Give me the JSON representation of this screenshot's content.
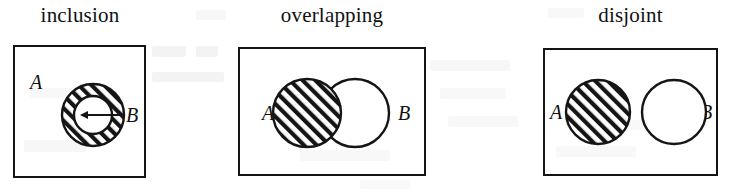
{
  "figure": {
    "caption_type": "venn-diagram-set-relations",
    "stroke_color": "#151515",
    "background_color": "#ffffff",
    "hatch_color": "#151515",
    "panels": [
      {
        "id": "inclusion",
        "title": "inclusion",
        "label_a": "A",
        "label_b": "B",
        "relation": "B is a subset of A",
        "box": {
          "x": 13,
          "y": 45,
          "w": 133,
          "h": 133
        },
        "shapes": {
          "outer_circle": {
            "cx": 93,
            "cy": 115,
            "r": 31,
            "fill": "hatched"
          },
          "inner_circle": {
            "cx": 93,
            "cy": 115,
            "r": 19,
            "fill": "white"
          },
          "arrow": {
            "from_x": 122,
            "from_y": 115,
            "to_x": 80,
            "to_y": 115,
            "direction": "left"
          }
        },
        "label_a_pos": {
          "x": 30,
          "y": 72
        },
        "label_b_pos": {
          "x": 126,
          "y": 105
        }
      },
      {
        "id": "overlapping",
        "title": "overlapping",
        "label_a": "A",
        "label_b": "B",
        "relation": "A and B intersect",
        "box": {
          "x": 238,
          "y": 47,
          "w": 188,
          "h": 129
        },
        "shapes": {
          "circle_a": {
            "cx": 307,
            "cy": 113,
            "r": 34,
            "fill": "hatched"
          },
          "circle_b": {
            "cx": 355,
            "cy": 113,
            "r": 34,
            "fill": "white"
          }
        },
        "label_a_pos": {
          "x": 262,
          "y": 103
        },
        "label_b_pos": {
          "x": 398,
          "y": 103
        }
      },
      {
        "id": "disjoint",
        "title": "disjoint",
        "label_a": "A",
        "label_b": "B",
        "relation": "A and B have no common elements",
        "box": {
          "x": 543,
          "y": 48,
          "w": 175,
          "h": 128
        },
        "shapes": {
          "circle_a": {
            "cx": 598,
            "cy": 112,
            "r": 32,
            "fill": "hatched"
          },
          "circle_b": {
            "cx": 674,
            "cy": 112,
            "r": 32,
            "fill": "white"
          }
        },
        "label_a_pos": {
          "x": 550,
          "y": 102
        },
        "label_b_pos": {
          "x": 700,
          "y": 102
        }
      }
    ]
  }
}
